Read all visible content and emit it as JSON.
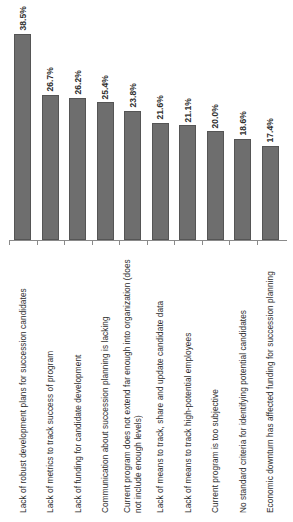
{
  "chart_data": {
    "type": "bar",
    "title": "",
    "subtitle": "",
    "xlabel": "",
    "ylabel": "",
    "ylim": [
      0,
      42
    ],
    "grid": false,
    "legend": "none",
    "orientation": "vertical",
    "value_suffix": "%",
    "bar_color": "#6e6e6e",
    "categories": [
      "Lack of robust development plans for succession candidates",
      "Lack of metrics to track success of program",
      "Lack of funding for candidate development",
      "Communication about succession planning is lacking",
      "Current program does not extend far enough into organization (does not include enough levels)",
      "Lack of means to track, share and update candidate data",
      "Lack of means to track high-potential employees",
      "Current program is too subjective",
      "No standard criteria for identifying potential candidates",
      "Economic downturn has affected funding for succession planning"
    ],
    "values": [
      38.5,
      26.7,
      26.2,
      25.4,
      23.8,
      21.6,
      21.1,
      20.0,
      18.6,
      17.4
    ],
    "value_labels": [
      "38.5%",
      "26.7%",
      "26.2%",
      "25.4%",
      "23.8%",
      "21.6%",
      "21.1%",
      "20.0%",
      "18.6%",
      "17.4%"
    ]
  }
}
